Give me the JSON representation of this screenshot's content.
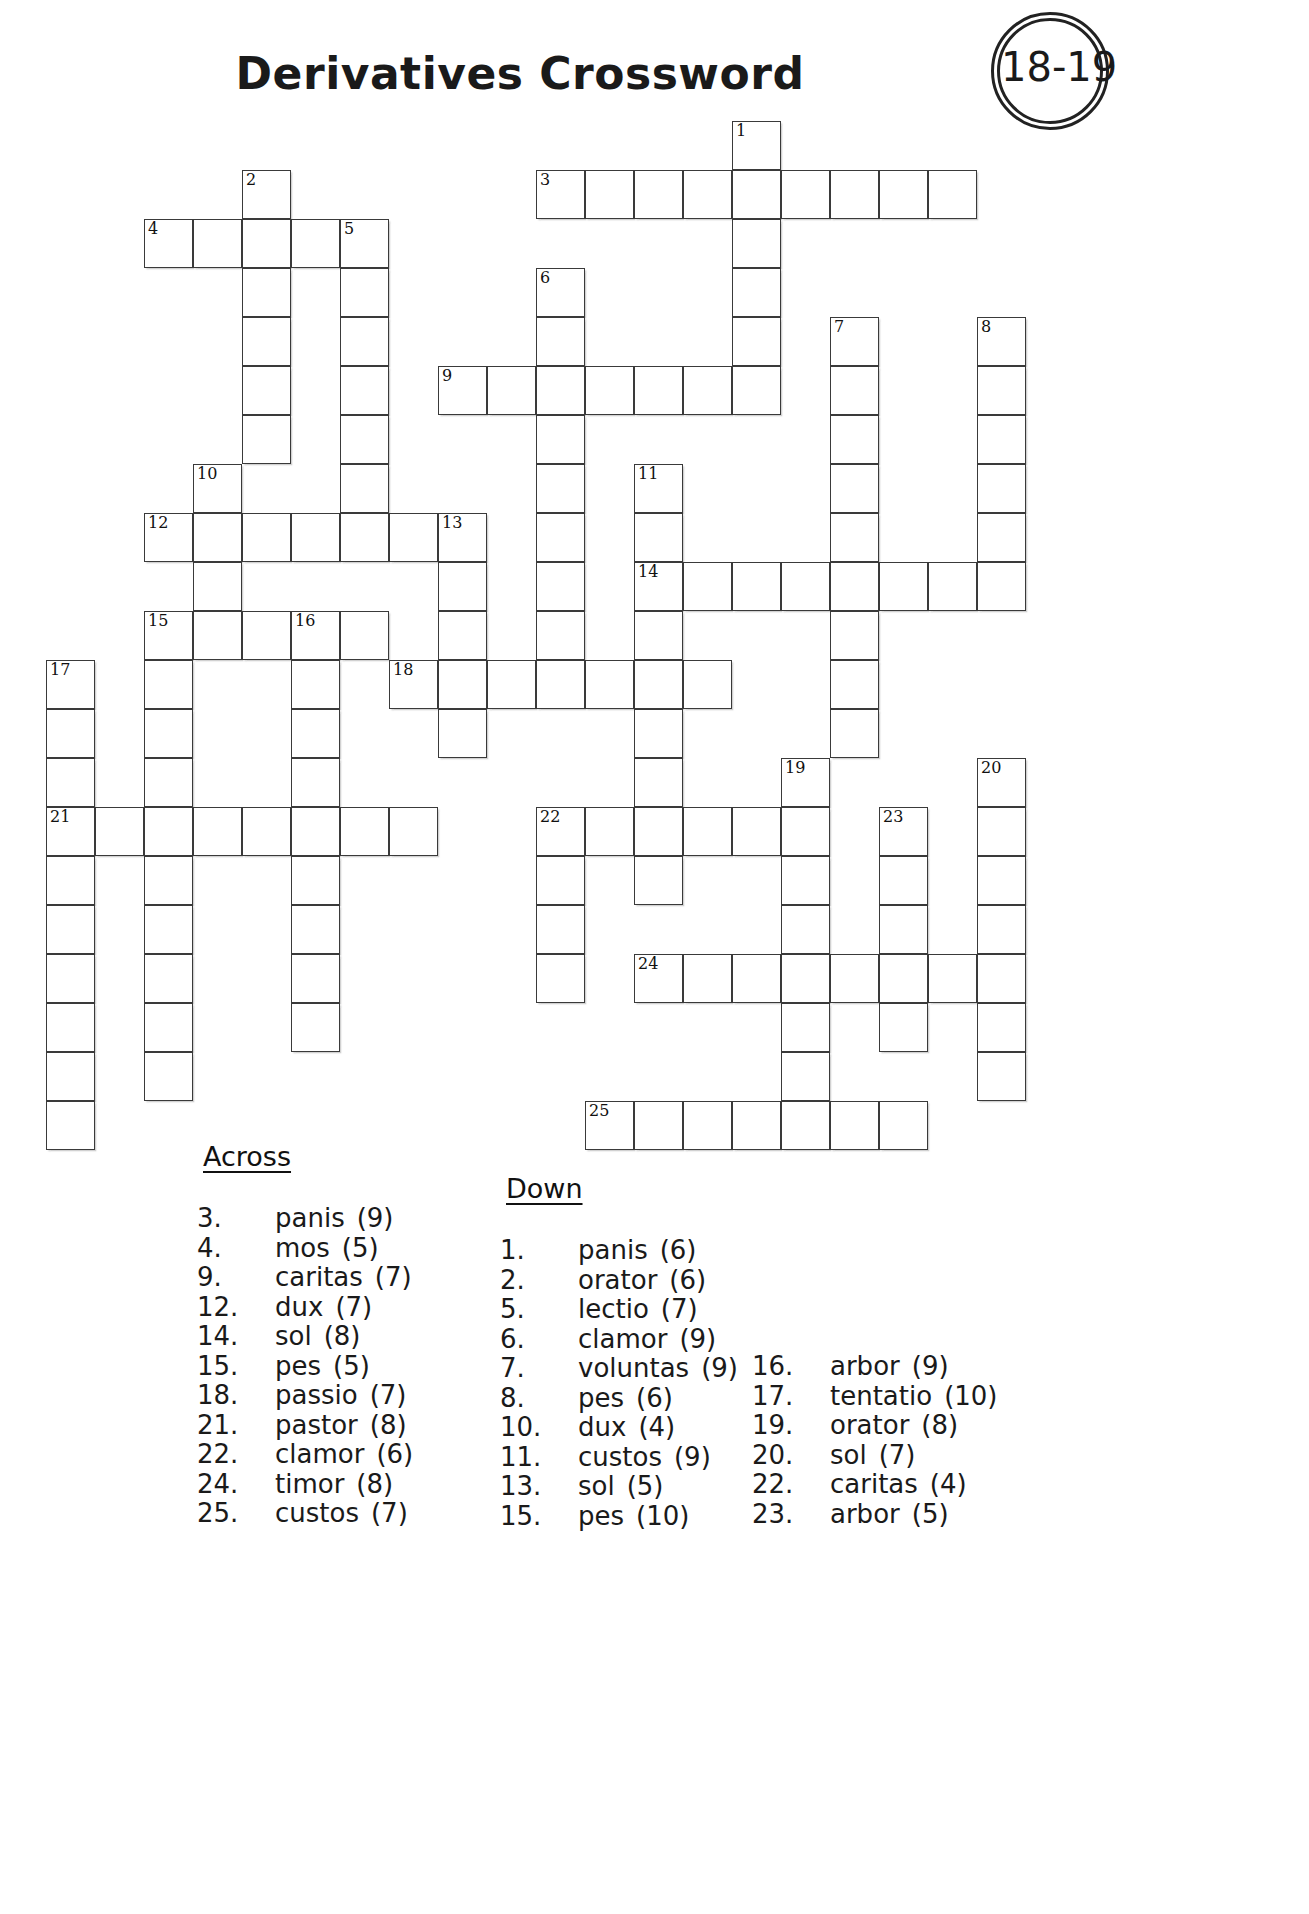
{
  "header": {
    "title": "Derivatives Crossword",
    "badge_text": "18-19"
  },
  "clues": {
    "across_heading": "Across",
    "down_heading": "Down",
    "across": [
      {
        "num": "3.",
        "word": "panis",
        "len": "(9)"
      },
      {
        "num": "4.",
        "word": "mos",
        "len": "(5)"
      },
      {
        "num": "9.",
        "word": "caritas",
        "len": "(7)"
      },
      {
        "num": "12.",
        "word": "dux",
        "len": "(7)"
      },
      {
        "num": "14.",
        "word": "sol",
        "len": "(8)"
      },
      {
        "num": "15.",
        "word": "pes",
        "len": "(5)"
      },
      {
        "num": "18.",
        "word": "passio",
        "len": "(7)"
      },
      {
        "num": "21.",
        "word": "pastor",
        "len": "(8)"
      },
      {
        "num": "22.",
        "word": "clamor",
        "len": "(6)"
      },
      {
        "num": "24.",
        "word": "timor",
        "len": "(8)"
      },
      {
        "num": "25.",
        "word": "custos",
        "len": "(7)"
      }
    ],
    "down_col1": [
      {
        "num": "1.",
        "word": "panis",
        "len": "(6)"
      },
      {
        "num": "2.",
        "word": "orator",
        "len": "(6)"
      },
      {
        "num": "5.",
        "word": "lectio",
        "len": "(7)"
      },
      {
        "num": "6.",
        "word": "clamor",
        "len": "(9)"
      },
      {
        "num": "7.",
        "word": "voluntas",
        "len": "(9)"
      },
      {
        "num": "8.",
        "word": "pes",
        "len": "(6)"
      },
      {
        "num": "10.",
        "word": "dux",
        "len": "(4)"
      },
      {
        "num": "11.",
        "word": "custos",
        "len": "(9)"
      },
      {
        "num": "13.",
        "word": "sol",
        "len": "(5)"
      },
      {
        "num": "15.",
        "word": "pes",
        "len": "(10)"
      }
    ],
    "down_col2": [
      {
        "num": "16.",
        "word": "arbor",
        "len": "(9)"
      },
      {
        "num": "17.",
        "word": "tentatio",
        "len": "(10)"
      },
      {
        "num": "19.",
        "word": "orator",
        "len": "(8)"
      },
      {
        "num": "20.",
        "word": "sol",
        "len": "(7)"
      },
      {
        "num": "22.",
        "word": "caritas",
        "len": "(4)"
      },
      {
        "num": "23.",
        "word": "arbor",
        "len": "(5)"
      }
    ]
  },
  "grid": {
    "cell_size": 49,
    "origin_x": 46,
    "origin_y": 121,
    "entries": [
      {
        "num": "1",
        "dir": "down",
        "col": 14,
        "row": 0,
        "len": 6
      },
      {
        "num": "3",
        "dir": "across",
        "col": 10,
        "row": 1,
        "len": 9
      },
      {
        "num": "2",
        "dir": "down",
        "col": 4,
        "row": 1,
        "len": 6
      },
      {
        "num": "4",
        "dir": "across",
        "col": 2,
        "row": 2,
        "len": 5
      },
      {
        "num": "5",
        "dir": "down",
        "col": 6,
        "row": 2,
        "len": 7
      },
      {
        "num": "6",
        "dir": "down",
        "col": 10,
        "row": 3,
        "len": 9
      },
      {
        "num": "7",
        "dir": "down",
        "col": 16,
        "row": 4,
        "len": 9
      },
      {
        "num": "8",
        "dir": "down",
        "col": 19,
        "row": 4,
        "len": 6
      },
      {
        "num": "9",
        "dir": "across",
        "col": 8,
        "row": 5,
        "len": 7
      },
      {
        "num": "10",
        "dir": "down",
        "col": 3,
        "row": 7,
        "len": 4
      },
      {
        "num": "11",
        "dir": "down",
        "col": 12,
        "row": 7,
        "len": 9
      },
      {
        "num": "12",
        "dir": "across",
        "col": 2,
        "row": 8,
        "len": 7
      },
      {
        "num": "13",
        "dir": "down",
        "col": 8,
        "row": 8,
        "len": 5
      },
      {
        "num": "14",
        "dir": "across",
        "col": 12,
        "row": 9,
        "len": 8
      },
      {
        "num": "15",
        "dir": "across",
        "col": 2,
        "row": 10,
        "len": 5
      },
      {
        "num": "15",
        "dir": "down",
        "col": 2,
        "row": 10,
        "len": 10
      },
      {
        "num": "16",
        "dir": "down",
        "col": 5,
        "row": 10,
        "len": 9
      },
      {
        "num": "17",
        "dir": "down",
        "col": 0,
        "row": 11,
        "len": 10
      },
      {
        "num": "18",
        "dir": "across",
        "col": 7,
        "row": 11,
        "len": 7
      },
      {
        "num": "19",
        "dir": "down",
        "col": 15,
        "row": 13,
        "len": 8
      },
      {
        "num": "20",
        "dir": "down",
        "col": 19,
        "row": 13,
        "len": 7
      },
      {
        "num": "21",
        "dir": "across",
        "col": 0,
        "row": 14,
        "len": 8
      },
      {
        "num": "22",
        "dir": "across",
        "col": 10,
        "row": 14,
        "len": 6
      },
      {
        "num": "22",
        "dir": "down",
        "col": 10,
        "row": 14,
        "len": 4
      },
      {
        "num": "23",
        "dir": "down",
        "col": 17,
        "row": 14,
        "len": 5
      },
      {
        "num": "24",
        "dir": "across",
        "col": 12,
        "row": 17,
        "len": 8
      },
      {
        "num": "25",
        "dir": "across",
        "col": 11,
        "row": 20,
        "len": 7
      }
    ]
  }
}
